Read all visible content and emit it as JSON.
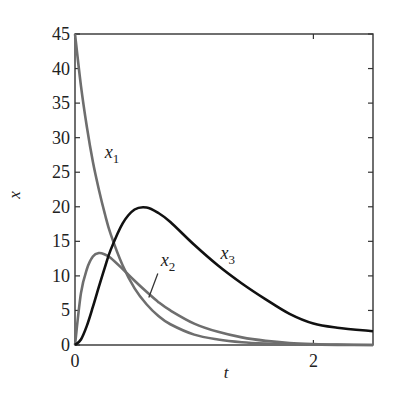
{
  "chart_data": {
    "type": "line",
    "title": "",
    "xlabel": "t",
    "ylabel": "x",
    "xlim": [
      0,
      2.5
    ],
    "ylim": [
      0,
      45
    ],
    "x_ticks": [
      0,
      2
    ],
    "x_tick_labels": [
      "0",
      "2"
    ],
    "y_ticks": [
      0,
      5,
      10,
      15,
      20,
      25,
      30,
      35,
      40,
      45
    ],
    "y_tick_labels": [
      "0",
      "5",
      "10",
      "15",
      "20",
      "25",
      "30",
      "35",
      "40",
      "45"
    ],
    "grid": false,
    "legend": "none (inline curve labels)",
    "x": [
      0,
      0.05,
      0.1,
      0.15,
      0.2,
      0.25,
      0.3,
      0.4,
      0.5,
      0.6,
      0.7,
      0.8,
      1.0,
      1.2,
      1.4,
      1.6,
      1.8,
      2.0,
      2.2,
      2.5
    ],
    "series": [
      {
        "name": "x_1",
        "color": "#6e6e6e",
        "values": [
          45,
          37.5,
          31.5,
          26.5,
          22.5,
          19,
          16,
          11.5,
          8.2,
          5.9,
          4.2,
          3.0,
          1.5,
          0.8,
          0.4,
          0.2,
          0.1,
          0.05,
          0.02,
          0
        ]
      },
      {
        "name": "x_2",
        "color": "#6e6e6e",
        "values": [
          0,
          7.5,
          11.0,
          12.8,
          13.3,
          13.1,
          12.6,
          11.0,
          9.3,
          7.7,
          6.2,
          5.0,
          3.1,
          1.9,
          1.1,
          0.6,
          0.3,
          0.15,
          0.07,
          0
        ]
      },
      {
        "name": "x_3",
        "color": "#111111",
        "values": [
          0,
          0.8,
          2.8,
          5.5,
          8.4,
          11.2,
          13.8,
          17.6,
          19.6,
          19.9,
          19.1,
          17.8,
          14.5,
          11.5,
          8.9,
          6.6,
          4.5,
          3.1,
          2.5,
          2.0
        ]
      }
    ],
    "annotations": [
      {
        "text": "x",
        "sub": "1",
        "near_series": "x_1",
        "t": 0.25,
        "x": 27
      },
      {
        "text": "x",
        "sub": "2",
        "near_series": "x_2",
        "t": 0.72,
        "x": 11.5,
        "leader_line": true
      },
      {
        "text": "x",
        "sub": "3",
        "near_series": "x_3",
        "t": 1.22,
        "x": 12.5
      }
    ]
  }
}
